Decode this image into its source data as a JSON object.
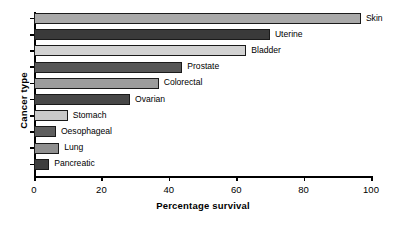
{
  "chart_data": {
    "type": "bar",
    "orientation": "horizontal",
    "title": "",
    "xlabel": "Percentage survival",
    "ylabel": "Cancer type",
    "xlim": [
      0,
      100
    ],
    "xticks": [
      0,
      20,
      40,
      60,
      80,
      100
    ],
    "xtick_labels": [
      "0",
      "20",
      "40",
      "60",
      "80",
      "100"
    ],
    "grid": false,
    "legend": "none",
    "categories": [
      "Skin",
      "Uterine",
      "Bladder",
      "Prostate",
      "Colorectal",
      "Ovarian",
      "Stomach",
      "Oesophageal",
      "Lung",
      "Pancreatic"
    ],
    "values": [
      97,
      70,
      63,
      44,
      37,
      28.5,
      10,
      6.5,
      7.5,
      4.5
    ],
    "bar_colors": [
      "#a9a9a9",
      "#3a3a3a",
      "#d2d2d2",
      "#565656",
      "#9c9c9c",
      "#474747",
      "#c9c9c9",
      "#5e5e5e",
      "#8f8f8f",
      "#3f3f3f"
    ],
    "bars": [
      {
        "label": "Skin",
        "value": 97,
        "color": "#a9a9a9"
      },
      {
        "label": "Uterine",
        "value": 70,
        "color": "#3a3a3a"
      },
      {
        "label": "Bladder",
        "value": 63,
        "color": "#d2d2d2"
      },
      {
        "label": "Prostate",
        "value": 44,
        "color": "#565656"
      },
      {
        "label": "Colorectal",
        "value": 37,
        "color": "#9c9c9c"
      },
      {
        "label": "Ovarian",
        "value": 28.5,
        "color": "#474747"
      },
      {
        "label": "Stomach",
        "value": 10,
        "color": "#c9c9c9"
      },
      {
        "label": "Oesophageal",
        "value": 6.5,
        "color": "#5e5e5e"
      },
      {
        "label": "Lung",
        "value": 7.5,
        "color": "#8f8f8f"
      },
      {
        "label": "Pancreatic",
        "value": 4.5,
        "color": "#3f3f3f"
      }
    ]
  }
}
